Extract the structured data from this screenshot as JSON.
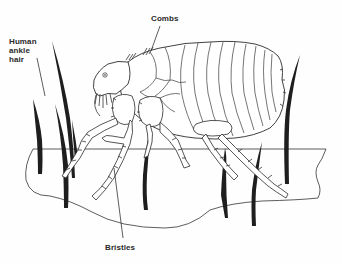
{
  "diagram": {
    "labels": {
      "combs": "Combs",
      "human_ankle_hair": [
        "Human",
        "ankle",
        "hair"
      ],
      "bristles": "Bristles"
    },
    "colors": {
      "ink": "#2b2b2b",
      "hair": "#1e1e1e",
      "background": "#fefefe"
    }
  }
}
